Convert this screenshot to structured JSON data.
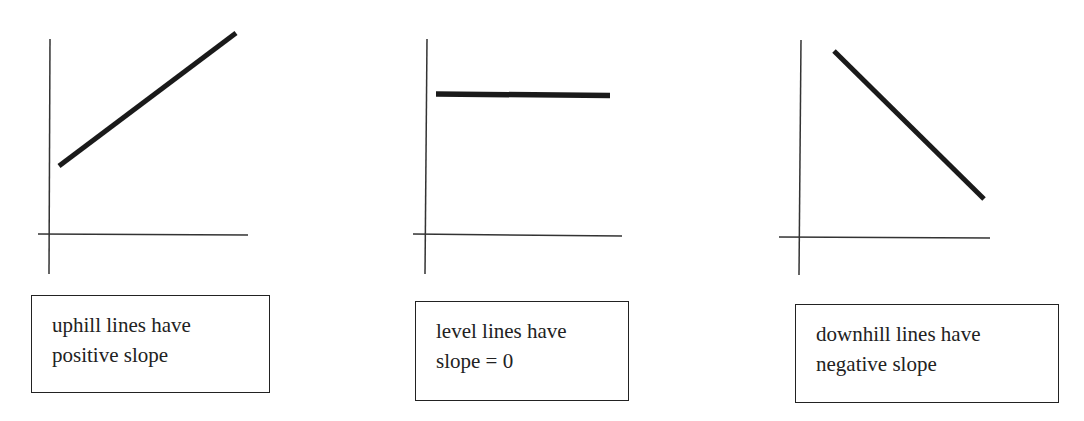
{
  "panels": [
    {
      "id": "uphill",
      "caption_lines": [
        "uphill lines have",
        "positive slope"
      ],
      "slope": "positive"
    },
    {
      "id": "level",
      "caption_lines": [
        "level lines have",
        "slope = 0"
      ],
      "slope": "zero"
    },
    {
      "id": "downhill",
      "caption_lines": [
        "downhill lines have",
        "negative slope"
      ],
      "slope": "negative"
    }
  ],
  "colors": {
    "axis": "#333333",
    "line": "#1a1a1a",
    "text": "#222222",
    "background": "#ffffff"
  }
}
